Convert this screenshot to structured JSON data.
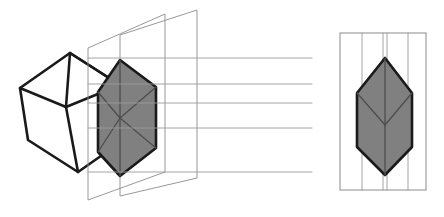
{
  "figure": {
    "canvas": {
      "width": 444,
      "height": 217,
      "background": "#ffffff"
    },
    "colors": {
      "face_fill": "#808080",
      "solid_outline": "#1a1a1a",
      "interior_edge": "#4d4d4d",
      "plane_line": "#8c8c8c",
      "guide_line": "#9a9a9a",
      "panel_border": "#8c8c8c",
      "background": "#ffffff"
    },
    "stroke_widths": {
      "solid_outline": 2.6,
      "interior_edge": 1.3,
      "plane_line": 0.9,
      "guide_line": 0.9,
      "panel_border": 1.0
    }
  },
  "chart_data": {
    "type": "diagram",
    "parts": [
      {
        "name": "left-wireframe-cube",
        "kind": "polyline-solid",
        "fill": "none",
        "stroke": "#1a1a1a",
        "outline": [
          [
            70,
            53
          ],
          [
            20,
            88
          ],
          [
            28,
            140
          ],
          [
            78,
            172
          ],
          [
            128,
            137
          ],
          [
            120,
            85
          ]
        ],
        "interior_edges": [
          [
            [
              70,
              53
            ],
            [
              120,
              85
            ]
          ],
          [
            [
              120,
              85
            ],
            [
              128,
              137
            ]
          ],
          [
            [
              70,
              53
            ],
            [
              66,
              107
            ]
          ],
          [
            [
              66,
              107
            ],
            [
              20,
              88
            ]
          ],
          [
            [
              66,
              107
            ],
            [
              78,
              172
            ]
          ],
          [
            [
              66,
              107
            ],
            [
              120,
              85
            ]
          ]
        ]
      },
      {
        "name": "picture-plane-far",
        "kind": "parallelogram",
        "stroke": "#8c8c8c",
        "vertices": [
          [
            88,
            48
          ],
          [
            165,
            14
          ],
          [
            165,
            172
          ],
          [
            88,
            200
          ]
        ]
      },
      {
        "name": "picture-plane-near",
        "kind": "parallelogram",
        "stroke": "#8c8c8c",
        "vertices": [
          [
            120,
            35
          ],
          [
            197,
            10
          ],
          [
            197,
            178
          ],
          [
            120,
            196
          ]
        ]
      },
      {
        "name": "center-projected-hexagon",
        "kind": "filled-hexagon",
        "fill": "#808080",
        "stroke": "#1a1a1a",
        "vertices": [
          [
            120,
            60
          ],
          [
            156,
            87
          ],
          [
            156,
            148
          ],
          [
            120,
            176
          ],
          [
            98,
            152
          ],
          [
            98,
            92
          ]
        ],
        "interior_edges": [
          [
            [
              120,
              60
            ],
            [
              120,
              176
            ]
          ],
          [
            [
              120,
              118
            ],
            [
              98,
              92
            ]
          ],
          [
            [
              120,
              118
            ],
            [
              156,
              87
            ]
          ],
          [
            [
              120,
              118
            ],
            [
              98,
              152
            ]
          ],
          [
            [
              120,
              118
            ],
            [
              156,
              148
            ]
          ]
        ]
      },
      {
        "name": "projector-rays",
        "kind": "horizontal-lines",
        "stroke": "#9a9a9a",
        "count": 5,
        "x_start": 88,
        "x_end": 312,
        "y_values": [
          58,
          84,
          103,
          128,
          172
        ]
      },
      {
        "name": "right-panel-frame",
        "kind": "rectangle",
        "stroke": "#8c8c8c",
        "fill": "none",
        "x": 340,
        "y": 33,
        "width": 86,
        "height": 157
      },
      {
        "name": "right-panel-guides",
        "kind": "vertical-lines",
        "stroke": "#9a9a9a",
        "x_values": [
          362,
          383,
          387,
          408
        ],
        "y_start": 33,
        "y_end": 190
      },
      {
        "name": "right-projected-hexagon",
        "kind": "filled-hexagon",
        "fill": "#808080",
        "stroke": "#1a1a1a",
        "vertices": [
          [
            385,
            58
          ],
          [
            412,
            93
          ],
          [
            412,
            147
          ],
          [
            385,
            175
          ],
          [
            357,
            147
          ],
          [
            357,
            93
          ]
        ],
        "interior_edges": [
          [
            [
              385,
              58
            ],
            [
              385,
              175
            ]
          ],
          [
            [
              385,
              125
            ],
            [
              357,
              93
            ]
          ],
          [
            [
              385,
              125
            ],
            [
              412,
              93
            ]
          ]
        ]
      }
    ]
  }
}
